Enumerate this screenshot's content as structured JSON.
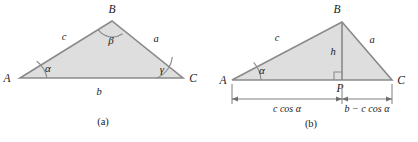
{
  "figure": {
    "background_color": "#ffffff",
    "fill_color": "#dedede",
    "stroke_color": "#8a8a8a",
    "text_color": "#1a1a1a",
    "panels": [
      {
        "id": "panel-a",
        "caption": "(a)",
        "vertices": [
          {
            "name": "A",
            "label": "A"
          },
          {
            "name": "B",
            "label": "B"
          },
          {
            "name": "C",
            "label": "C"
          }
        ],
        "sides": [
          {
            "name": "side-c",
            "label": "c"
          },
          {
            "name": "side-a",
            "label": "a"
          },
          {
            "name": "side-b",
            "label": "b"
          }
        ],
        "angles": [
          {
            "name": "angle-alpha",
            "label": "α",
            "at": "A"
          },
          {
            "name": "angle-beta",
            "label": "β",
            "at": "B"
          },
          {
            "name": "angle-gamma",
            "label": "γ",
            "at": "C"
          }
        ]
      },
      {
        "id": "panel-b",
        "caption": "(b)",
        "vertices": [
          {
            "name": "A",
            "label": "A"
          },
          {
            "name": "B",
            "label": "B"
          },
          {
            "name": "C",
            "label": "C"
          },
          {
            "name": "P",
            "label": "P"
          }
        ],
        "sides": [
          {
            "name": "side-c",
            "label": "c"
          },
          {
            "name": "side-a",
            "label": "a"
          },
          {
            "name": "altitude-h",
            "label": "h"
          }
        ],
        "angles": [
          {
            "name": "angle-alpha",
            "label": "α",
            "at": "A"
          },
          {
            "name": "right-angle",
            "label": "",
            "at": "P"
          }
        ],
        "dimensions": [
          {
            "name": "dim-left",
            "label": "c cos α"
          },
          {
            "name": "dim-right",
            "label": "b − c cos α"
          }
        ]
      }
    ]
  }
}
